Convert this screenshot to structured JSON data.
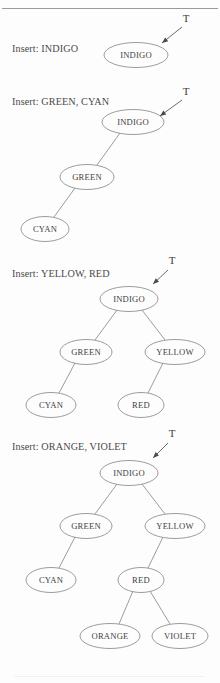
{
  "page": {
    "background": "#fdfdfd",
    "stroke_color": "#8a8a8a",
    "text_color": "#3f3f3f"
  },
  "root_pointer_label": "T",
  "sections": [
    {
      "id": "step-1",
      "caption": "Insert: INDIGO",
      "caption_x": 12,
      "caption_y": 43,
      "pointer": {
        "label": "T",
        "label_x": 186,
        "label_y": 22,
        "shaft_x1": 182,
        "shaft_y1": 27,
        "shaft_x2": 162,
        "shaft_y2": 43
      },
      "nodes": [
        {
          "name": "node-indigo",
          "label": "INDIGO",
          "cx": 136,
          "cy": 55,
          "rx": 32,
          "ry": 12.5
        }
      ],
      "edges": []
    },
    {
      "id": "step-2",
      "caption": "Insert: GREEN, CYAN",
      "caption_x": 12,
      "caption_y": 96,
      "pointer": {
        "label": "T",
        "label_x": 186,
        "label_y": 95,
        "shaft_x1": 182,
        "shaft_y1": 100,
        "shaft_x2": 160,
        "shaft_y2": 116
      },
      "nodes": [
        {
          "name": "node-indigo",
          "label": "INDIGO",
          "cx": 133,
          "cy": 122,
          "rx": 31,
          "ry": 12.5
        },
        {
          "name": "node-green",
          "label": "GREEN",
          "cx": 87,
          "cy": 177,
          "rx": 27,
          "ry": 12.5
        },
        {
          "name": "node-cyan",
          "label": "CYAN",
          "cx": 45,
          "cy": 229,
          "rx": 24,
          "ry": 12.5
        }
      ],
      "edges": [
        {
          "from": "INDIGO",
          "to": "GREEN",
          "x1": 120,
          "y1": 133,
          "x2": 97,
          "y2": 165
        },
        {
          "from": "GREEN",
          "to": "CYAN",
          "x1": 75,
          "y1": 188,
          "x2": 54,
          "y2": 217
        }
      ]
    },
    {
      "id": "step-3",
      "caption": "Insert: YELLOW, RED",
      "caption_x": 12,
      "caption_y": 268,
      "pointer": {
        "label": "T",
        "label_x": 172,
        "label_y": 264,
        "shaft_x1": 168,
        "shaft_y1": 270,
        "shaft_x2": 153,
        "shaft_y2": 284
      },
      "nodes": [
        {
          "name": "node-indigo",
          "label": "INDIGO",
          "cx": 129,
          "cy": 299,
          "rx": 29,
          "ry": 12.5
        },
        {
          "name": "node-green",
          "label": "GREEN",
          "cx": 86,
          "cy": 352,
          "rx": 26,
          "ry": 12.5
        },
        {
          "name": "node-yellow",
          "label": "YELLOW",
          "cx": 175,
          "cy": 352,
          "rx": 30,
          "ry": 12.5
        },
        {
          "name": "node-cyan",
          "label": "CYAN",
          "cx": 51,
          "cy": 405,
          "rx": 25,
          "ry": 12.5
        },
        {
          "name": "node-red",
          "label": "RED",
          "cx": 141,
          "cy": 405,
          "rx": 23,
          "ry": 12.5
        }
      ],
      "edges": [
        {
          "from": "INDIGO",
          "to": "GREEN",
          "x1": 117,
          "y1": 310,
          "x2": 95,
          "y2": 340
        },
        {
          "from": "INDIGO",
          "to": "YELLOW",
          "x1": 142,
          "y1": 310,
          "x2": 165,
          "y2": 340
        },
        {
          "from": "GREEN",
          "to": "CYAN",
          "x1": 75,
          "y1": 363,
          "x2": 59,
          "y2": 393
        },
        {
          "from": "YELLOW",
          "to": "RED",
          "x1": 163,
          "y1": 363,
          "x2": 148,
          "y2": 393
        }
      ]
    },
    {
      "id": "step-4",
      "caption": "Insert: ORANGE, VIOLET",
      "caption_x": 12,
      "caption_y": 441,
      "pointer": {
        "label": "T",
        "label_x": 172,
        "label_y": 437,
        "shaft_x1": 168,
        "shaft_y1": 443,
        "shaft_x2": 153,
        "shaft_y2": 458
      },
      "nodes": [
        {
          "name": "node-indigo",
          "label": "INDIGO",
          "cx": 129,
          "cy": 473,
          "rx": 29,
          "ry": 12.5
        },
        {
          "name": "node-green",
          "label": "GREEN",
          "cx": 86,
          "cy": 526,
          "rx": 26,
          "ry": 12.5
        },
        {
          "name": "node-yellow",
          "label": "YELLOW",
          "cx": 175,
          "cy": 526,
          "rx": 30,
          "ry": 12.5
        },
        {
          "name": "node-cyan",
          "label": "CYAN",
          "cx": 51,
          "cy": 580,
          "rx": 25,
          "ry": 12.5
        },
        {
          "name": "node-red",
          "label": "RED",
          "cx": 141,
          "cy": 580,
          "rx": 23,
          "ry": 12.5
        },
        {
          "name": "node-orange",
          "label": "ORANGE",
          "cx": 110,
          "cy": 636,
          "rx": 30,
          "ry": 12.5
        },
        {
          "name": "node-violet",
          "label": "VIOLET",
          "cx": 180,
          "cy": 636,
          "rx": 28,
          "ry": 12.5
        }
      ],
      "edges": [
        {
          "from": "INDIGO",
          "to": "GREEN",
          "x1": 117,
          "y1": 484,
          "x2": 95,
          "y2": 514
        },
        {
          "from": "INDIGO",
          "to": "YELLOW",
          "x1": 142,
          "y1": 484,
          "x2": 165,
          "y2": 514
        },
        {
          "from": "GREEN",
          "to": "CYAN",
          "x1": 75,
          "y1": 537,
          "x2": 59,
          "y2": 568
        },
        {
          "from": "YELLOW",
          "to": "RED",
          "x1": 163,
          "y1": 537,
          "x2": 148,
          "y2": 568
        },
        {
          "from": "RED",
          "to": "ORANGE",
          "x1": 133,
          "y1": 591,
          "x2": 119,
          "y2": 624
        },
        {
          "from": "RED",
          "to": "VIOLET",
          "x1": 150,
          "y1": 591,
          "x2": 170,
          "y2": 624
        }
      ]
    }
  ]
}
